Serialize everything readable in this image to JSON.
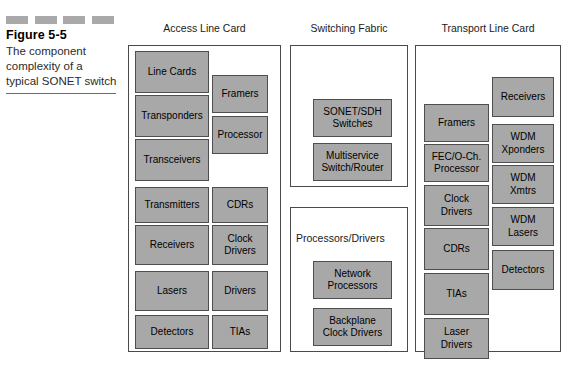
{
  "figure": {
    "number": "Figure 5-5",
    "caption": "The component complexity of a typical SONET switch",
    "dash_count": 4,
    "colors": {
      "block_fill": "#a8a8a8",
      "block_border": "#4e4e4e",
      "panel_border": "#4a4a4a",
      "dash": "#a9a9a9"
    }
  },
  "panels": [
    {
      "heading": "Access Line Card",
      "left_column": [
        {
          "lines": [
            "Line Cards"
          ]
        },
        {
          "lines": [
            "Transponders"
          ]
        },
        {
          "lines": [
            "Transceivers"
          ]
        },
        {
          "lines": [
            "Transmitters"
          ]
        },
        {
          "lines": [
            "Receivers"
          ]
        },
        {
          "lines": [
            "Lasers"
          ]
        },
        {
          "lines": [
            "Detectors"
          ]
        }
      ],
      "right_column": [
        {
          "lines": [
            "Framers"
          ]
        },
        {
          "lines": [
            "Processor"
          ]
        },
        {
          "lines": [
            "CDRs"
          ]
        },
        {
          "lines": [
            "Clock",
            "Drivers"
          ]
        },
        {
          "lines": [
            "Drivers"
          ]
        },
        {
          "lines": [
            "TIAs"
          ]
        }
      ]
    },
    {
      "heading": "Switching Fabric",
      "sub_panels": [
        {
          "label": "",
          "blocks": [
            {
              "lines": [
                "SONET/SDH",
                "Switches"
              ]
            },
            {
              "lines": [
                "Multiservice",
                "Switch/Router"
              ]
            }
          ]
        },
        {
          "label": "Processors/Drivers",
          "blocks": [
            {
              "lines": [
                "Network",
                "Processors"
              ]
            },
            {
              "lines": [
                "Backplane",
                "Clock Drivers"
              ]
            }
          ]
        }
      ]
    },
    {
      "heading": "Transport Line Card",
      "left_column": [
        {
          "lines": [
            "Framers"
          ]
        },
        {
          "lines": [
            "FEC/O-Ch.",
            "Processor"
          ]
        },
        {
          "lines": [
            "Clock",
            "Drivers"
          ]
        },
        {
          "lines": [
            "CDRs"
          ]
        },
        {
          "lines": [
            "TIAs"
          ]
        },
        {
          "lines": [
            "Laser",
            "Drivers"
          ]
        }
      ],
      "right_column": [
        {
          "lines": [
            "Receivers"
          ]
        },
        {
          "lines": [
            "WDM",
            "Xponders"
          ]
        },
        {
          "lines": [
            "WDM",
            "Xmtrs"
          ]
        },
        {
          "lines": [
            "WDM",
            "Lasers"
          ]
        },
        {
          "lines": [
            "Detectors"
          ]
        }
      ]
    }
  ]
}
